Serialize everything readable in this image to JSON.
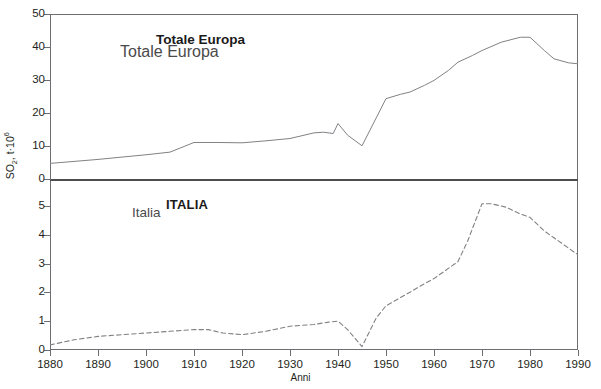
{
  "axes": {
    "y_title": "SO2, t·106",
    "y_title_parts": {
      "prefix": "SO",
      "sub": "2",
      "mid": ", t·10",
      "sup": "6"
    },
    "x_title": "Anni",
    "upper_ticks": [
      "50",
      "40",
      "30",
      "20",
      "10",
      "0"
    ],
    "lower_ticks": [
      "5",
      "4",
      "3",
      "2",
      "1",
      "0"
    ],
    "x_ticks": [
      "1880",
      "1890",
      "1900",
      "1910",
      "1920",
      "1930",
      "1940",
      "1950",
      "1960",
      "1970",
      "1980",
      "1990"
    ]
  },
  "labels": {
    "europa_bold": "Totale Europa",
    "europa_plain": "Totale Europa",
    "italia_bold": "ITALIA",
    "italia_plain": "Italia"
  },
  "colors": {
    "line": "#808285",
    "frame": "#6d6e71",
    "divider": "#4d4d4f",
    "text": "#231f20",
    "background": "#ffffff"
  },
  "chart_data": [
    {
      "type": "line",
      "title": "Totale Europa",
      "panel": "upper",
      "xlabel": "Anni",
      "ylabel": "SO2, t·106",
      "xlim": [
        1880,
        1990
      ],
      "ylim": [
        0,
        50
      ],
      "grid": false,
      "legend": "inline-label",
      "linestyle": "solid",
      "series": [
        {
          "name": "Totale Europa",
          "x": [
            1880,
            1885,
            1890,
            1895,
            1900,
            1905,
            1910,
            1915,
            1920,
            1925,
            1930,
            1935,
            1937,
            1939,
            1940,
            1942,
            1945,
            1950,
            1953,
            1955,
            1958,
            1960,
            1963,
            1965,
            1968,
            1970,
            1974,
            1978,
            1980,
            1983,
            1985,
            1988,
            1990
          ],
          "values": [
            5.0,
            5.6,
            6.2,
            6.9,
            7.6,
            8.4,
            11.3,
            11.3,
            11.2,
            11.8,
            12.5,
            14.2,
            14.4,
            14.0,
            17.0,
            13.5,
            10.3,
            24.5,
            25.8,
            26.5,
            28.5,
            30.0,
            33.0,
            35.5,
            37.5,
            39.0,
            41.5,
            43.0,
            43.0,
            39.0,
            36.5,
            35.3,
            35.0
          ]
        }
      ]
    },
    {
      "type": "line",
      "title": "ITALIA",
      "panel": "lower",
      "xlabel": "Anni",
      "ylabel": "SO2, t·106",
      "xlim": [
        1880,
        1990
      ],
      "ylim": [
        0,
        5
      ],
      "grid": false,
      "legend": "inline-label",
      "linestyle": "dashed",
      "series": [
        {
          "name": "Italia",
          "x": [
            1880,
            1885,
            1890,
            1895,
            1900,
            1905,
            1910,
            1913,
            1916,
            1920,
            1925,
            1930,
            1935,
            1938,
            1940,
            1942,
            1945,
            1948,
            1950,
            1955,
            1958,
            1960,
            1963,
            1965,
            1967,
            1970,
            1972,
            1975,
            1978,
            1980,
            1983,
            1985,
            1988,
            1990
          ],
          "values": [
            0.15,
            0.3,
            0.4,
            0.45,
            0.5,
            0.55,
            0.6,
            0.6,
            0.5,
            0.45,
            0.55,
            0.7,
            0.75,
            0.82,
            0.85,
            0.6,
            0.1,
            0.95,
            1.3,
            1.7,
            1.95,
            2.1,
            2.4,
            2.6,
            3.2,
            4.3,
            4.3,
            4.2,
            4.0,
            3.9,
            3.5,
            3.3,
            3.0,
            2.8
          ]
        }
      ]
    }
  ]
}
